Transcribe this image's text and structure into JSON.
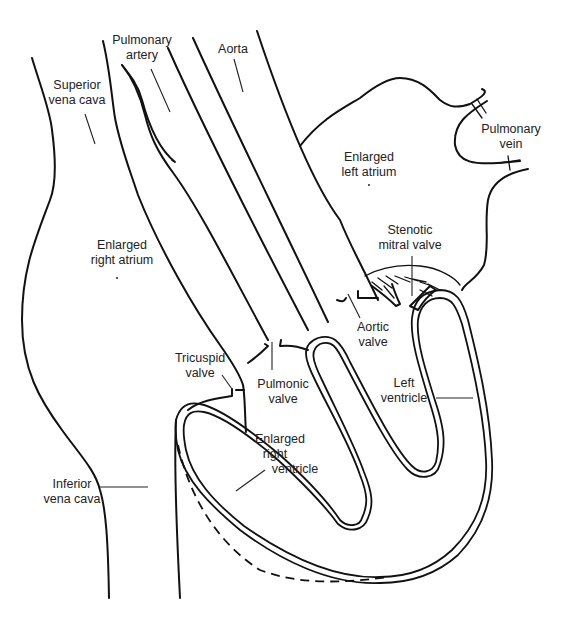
{
  "diagram": {
    "labels": {
      "superior_vena_cava": [
        "Superior",
        "vena cava"
      ],
      "pulmonary_artery": [
        "Pulmonary",
        "artery"
      ],
      "aorta": [
        "Aorta"
      ],
      "pulmonary_vein": [
        "Pulmonary",
        "vein"
      ],
      "enlarged_left_atrium": [
        "Enlarged",
        "left atrium"
      ],
      "stenotic_mitral_valve": [
        "Stenotic",
        "mitral valve"
      ],
      "enlarged_right_atrium": [
        "Enlarged",
        "right atrium"
      ],
      "aortic_valve": [
        "Aortic",
        "valve"
      ],
      "tricuspid_valve": [
        "Tricuspid",
        "valve"
      ],
      "pulmonic_valve": [
        "Pulmonic",
        "valve"
      ],
      "left_ventricle": [
        "Left",
        "ventricle"
      ],
      "enlarged_right_ventricle": [
        "Enlarged",
        "right",
        "ventricle"
      ],
      "inferior_vena_cava": [
        "Inferior",
        "vena cava"
      ]
    },
    "colors": {
      "line": "#111111",
      "text": "#222222",
      "background": "#ffffff"
    }
  }
}
